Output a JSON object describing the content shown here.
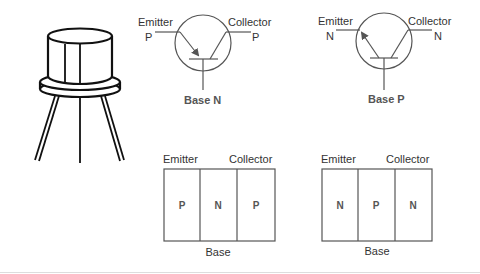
{
  "package": {
    "name": "transistor-package",
    "legs": 3
  },
  "pnp_symbol": {
    "type": "PNP",
    "emitter_label": "Emitter",
    "emitter_type": "P",
    "collector_label": "Collector",
    "collector_type": "P",
    "base_label": "Base N"
  },
  "npn_symbol": {
    "type": "NPN",
    "emitter_label": "Emitter",
    "emitter_type": "N",
    "collector_label": "Collector",
    "collector_type": "N",
    "base_label": "Base P"
  },
  "pnp_block": {
    "emitter_label": "Emitter",
    "collector_label": "Collector",
    "base_label": "Base",
    "regions": [
      "P",
      "N",
      "P"
    ]
  },
  "npn_block": {
    "emitter_label": "Emitter",
    "collector_label": "Collector",
    "base_label": "Base",
    "regions": [
      "N",
      "P",
      "N"
    ]
  },
  "colors": {
    "line": "#555555",
    "package": "#111111",
    "background": "#ffffff"
  }
}
